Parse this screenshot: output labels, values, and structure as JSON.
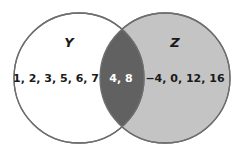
{
  "diagram": {
    "type": "venn",
    "sets": [
      {
        "name": "Y",
        "only_elements": "1, 2, 3, 5, 6, 7",
        "fill": "#ffffff"
      },
      {
        "name": "Z",
        "only_elements": "−4, 0, 12, 16",
        "fill": "#c4c4c4"
      }
    ],
    "intersection": {
      "elements": "4, 8",
      "fill": "#616161",
      "text_color": "#ffffff"
    },
    "stroke": "#6e6e6e",
    "text_color": "#1a1a1a"
  }
}
